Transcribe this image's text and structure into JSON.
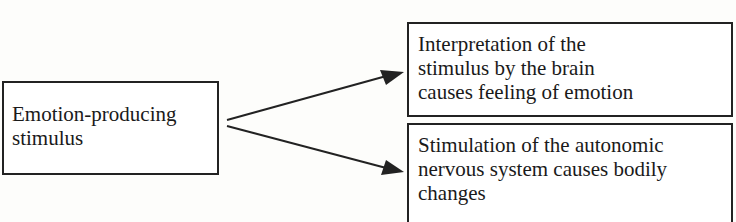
{
  "diagram": {
    "source_box": {
      "lines": [
        "Emotion-producing",
        "stimulus"
      ]
    },
    "target_boxes": [
      {
        "lines": [
          "Interpretation of the",
          "stimulus by the brain",
          "causes feeling of emotion"
        ]
      },
      {
        "lines": [
          "Stimulation of the autonomic",
          "nervous system causes bodily",
          "changes"
        ]
      }
    ],
    "arrows": [
      {
        "from": "source_box",
        "to": "target_boxes.0"
      },
      {
        "from": "source_box",
        "to": "target_boxes.1"
      }
    ],
    "colors": {
      "stroke": "#222222",
      "background": "#fdfdfb"
    }
  }
}
